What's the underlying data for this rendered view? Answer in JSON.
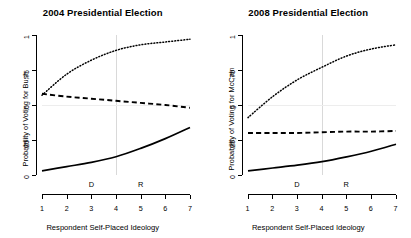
{
  "figure": {
    "width": 411,
    "height": 238,
    "background": "#ffffff",
    "reference_line_color": "#d9d9d9"
  },
  "panels": [
    {
      "id": "panel-2004",
      "title": "2004 Presidential Election",
      "ylabel": "Probability of Voting for Bush",
      "xlabel": "Respondent Self-Placed Ideology"
    },
    {
      "id": "panel-2008",
      "title": "2008 Presidential Election",
      "ylabel": "Probability of Voting for McCain",
      "xlabel": "Respondent Self-Placed Ideology"
    }
  ],
  "axis": {
    "x_ticks": [
      "1",
      "2",
      "3",
      "4",
      "5",
      "6",
      "7"
    ],
    "y_ticks": [
      "0",
      ".25",
      ".5",
      ".75",
      "1"
    ],
    "party_markers": [
      {
        "label": "D",
        "x": 3
      },
      {
        "label": "R",
        "x": 5
      }
    ]
  },
  "chart_data": [
    {
      "type": "line",
      "title": "2004 Presidential Election",
      "xlabel": "Respondent Self-Placed Ideology",
      "ylabel": "Probability of Voting for Bush",
      "xlim": [
        1,
        7
      ],
      "ylim": [
        0,
        1
      ],
      "x": [
        1,
        2,
        3,
        4,
        5,
        6,
        7
      ],
      "xtick_labels": [
        "1",
        "2",
        "3",
        "4",
        "5",
        "6",
        "7"
      ],
      "ytick_values": [
        0,
        0.25,
        0.5,
        0.75,
        1
      ],
      "ytick_labels": [
        "0",
        ".25",
        ".5",
        ".75",
        "1"
      ],
      "grid": false,
      "legend": "none",
      "annotations": [
        {
          "text": "D",
          "x": 3,
          "y": 0.04
        },
        {
          "text": "R",
          "x": 5,
          "y": 0.04
        }
      ],
      "reference_lines": [
        {
          "orientation": "vertical",
          "x": 4,
          "color": "#d9d9d9"
        },
        {
          "orientation": "horizontal",
          "y": 0.5,
          "color": "#ededed"
        }
      ],
      "series": [
        {
          "name": "dotted-upper",
          "style": "dotted",
          "values": [
            0.57,
            0.72,
            0.82,
            0.89,
            0.93,
            0.95,
            0.97
          ]
        },
        {
          "name": "dashed-middle",
          "style": "dashed",
          "values": [
            0.58,
            0.56,
            0.545,
            0.53,
            0.515,
            0.5,
            0.48
          ]
        },
        {
          "name": "solid-lower",
          "style": "solid",
          "values": [
            0.03,
            0.06,
            0.09,
            0.13,
            0.19,
            0.26,
            0.34
          ]
        }
      ]
    },
    {
      "type": "line",
      "title": "2008 Presidential Election",
      "xlabel": "Respondent Self-Placed Ideology",
      "ylabel": "Probability of Voting for McCain",
      "xlim": [
        1,
        7
      ],
      "ylim": [
        0,
        1
      ],
      "x": [
        1,
        2,
        3,
        4,
        5,
        6,
        7
      ],
      "xtick_labels": [
        "1",
        "2",
        "3",
        "4",
        "5",
        "6",
        "7"
      ],
      "ytick_values": [
        0,
        0.25,
        0.5,
        0.75,
        1
      ],
      "ytick_labels": [
        "0",
        ".25",
        ".5",
        ".75",
        "1"
      ],
      "grid": false,
      "legend": "none",
      "annotations": [
        {
          "text": "D",
          "x": 3,
          "y": 0.04
        },
        {
          "text": "R",
          "x": 5,
          "y": 0.04
        }
      ],
      "reference_lines": [
        {
          "orientation": "vertical",
          "x": 4,
          "color": "#d9d9d9"
        },
        {
          "orientation": "horizontal",
          "y": 0.5,
          "color": "#ededed"
        }
      ],
      "series": [
        {
          "name": "dotted-upper",
          "style": "dotted",
          "values": [
            0.41,
            0.56,
            0.68,
            0.77,
            0.85,
            0.9,
            0.93
          ]
        },
        {
          "name": "dashed-middle",
          "style": "dashed",
          "values": [
            0.3,
            0.3,
            0.3,
            0.305,
            0.31,
            0.31,
            0.315
          ]
        },
        {
          "name": "solid-lower",
          "style": "solid",
          "values": [
            0.03,
            0.05,
            0.07,
            0.095,
            0.13,
            0.17,
            0.22
          ]
        }
      ]
    }
  ]
}
